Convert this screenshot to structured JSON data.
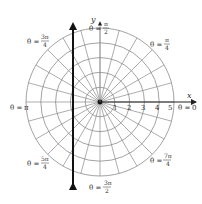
{
  "diagram": {
    "type": "polar-grid",
    "colors": {
      "grid": "#8a8a8a",
      "axis": "#222222",
      "vertical_line": "#111111",
      "text": "#333333",
      "background": "#ffffff"
    },
    "rings": [
      1,
      2,
      3,
      4,
      5
    ],
    "ray_count": 24,
    "axis_labels": {
      "x": "x",
      "y": "y"
    },
    "tick_labels": [
      "1",
      "2",
      "3",
      "4",
      "5"
    ],
    "angle_labels": [
      {
        "id": "theta-0",
        "prefix": "θ =",
        "num": "0",
        "den": ""
      },
      {
        "id": "theta-pi-4",
        "prefix": "θ =",
        "num": "π",
        "den": "4"
      },
      {
        "id": "theta-pi-2",
        "prefix": "θ =",
        "num": "π",
        "den": "2"
      },
      {
        "id": "theta-3pi-4",
        "prefix": "θ =",
        "num": "3π",
        "den": "4"
      },
      {
        "id": "theta-pi",
        "prefix": "θ =",
        "num": "π",
        "den": ""
      },
      {
        "id": "theta-5pi-4",
        "prefix": "θ =",
        "num": "5π",
        "den": "4"
      },
      {
        "id": "theta-3pi-2",
        "prefix": "θ =",
        "num": "3π",
        "den": "2"
      },
      {
        "id": "theta-7pi-4",
        "prefix": "θ =",
        "num": "7π",
        "den": "4"
      }
    ],
    "vertical_line": {
      "description": "thick double-headed vertical line (x = constant) left of origin"
    }
  }
}
